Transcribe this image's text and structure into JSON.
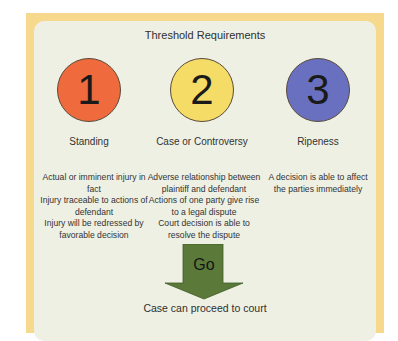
{
  "title": "Threshold Requirements",
  "requirements": [
    {
      "number": "1",
      "label": "Standing",
      "color": "#ef6a3c",
      "details": [
        "Actual or imminent injury in fact",
        "Injury traceable to actions of defendant",
        "Injury will be redressed by favorable decision"
      ]
    },
    {
      "number": "2",
      "label": "Case or Controversy",
      "color": "#f4dc66",
      "details": [
        "Adverse relationship between plaintiff and defendant",
        "Actions of one party give rise to a legal dispute",
        "Court decision is able to resolve the dispute"
      ]
    },
    {
      "number": "3",
      "label": "Ripeness",
      "color": "#6870bf",
      "details": [
        "A decision is able to affect the parties immediately"
      ]
    }
  ],
  "arrow": {
    "label": "Go",
    "color": "#5b7a3a",
    "direction": "down-arrow-icon"
  },
  "footer": "Case can proceed to court",
  "colors": {
    "frame": "#f6d98c",
    "panel": "#eef0e4"
  }
}
